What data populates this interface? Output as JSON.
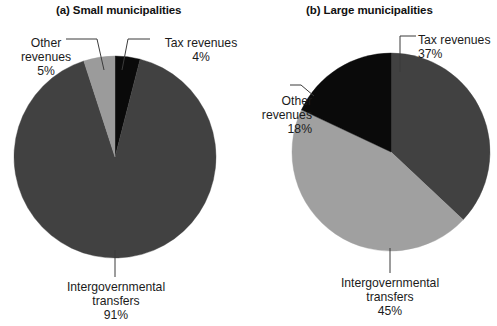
{
  "figure": {
    "background": "#ffffff",
    "panels": [
      {
        "id": "small",
        "title": "(a) Small municipalities",
        "center": {
          "x": 115,
          "y": 157
        },
        "radius": 101,
        "slices": [
          {
            "name": "Tax revenues",
            "value": 4,
            "value_label": "4%",
            "color": "#0a0a0a"
          },
          {
            "name": "Intergovernmental transfers",
            "value": 91,
            "value_label": "91%",
            "color": "#414141"
          },
          {
            "name": "Other revenues",
            "value": 5,
            "value_label": "5%",
            "color": "#9b9b9b"
          }
        ],
        "callouts": [
          {
            "id": "other",
            "lines": [
              "Other",
              "revenues",
              "5%"
            ]
          },
          {
            "id": "tax",
            "lines": [
              "Tax revenues",
              "4%"
            ]
          },
          {
            "id": "intergov",
            "lines": [
              "Intergovernmental",
              "transfers",
              "91%"
            ]
          }
        ]
      },
      {
        "id": "large",
        "title": "(b) Large municipalities",
        "center": {
          "x": 391,
          "y": 152
        },
        "radius": 99,
        "slices": [
          {
            "name": "Tax revenues",
            "value": 37,
            "value_label": "37%",
            "color": "#414141"
          },
          {
            "name": "Intergovernmental transfers",
            "value": 45,
            "value_label": "45%",
            "color": "#a0a0a0"
          },
          {
            "name": "Other revenues",
            "value": 18,
            "value_label": "18%",
            "color": "#0a0a0a"
          }
        ],
        "callouts": [
          {
            "id": "tax",
            "lines": [
              "Tax revenues",
              "37%"
            ]
          },
          {
            "id": "other",
            "lines": [
              "Other",
              "revenues",
              "18%"
            ]
          },
          {
            "id": "intergov",
            "lines": [
              "Intergovernmental",
              "transfers",
              "45%"
            ]
          }
        ]
      }
    ]
  },
  "chart_data": [
    {
      "type": "pie",
      "title": "(a) Small municipalities",
      "xlabel": "",
      "ylabel": "",
      "grid": false,
      "legend": "none (direct callout labels with leader lines)",
      "start_angle_deg": 0,
      "direction": "clockwise",
      "categories": [
        "Tax revenues",
        "Intergovernmental transfers",
        "Other revenues"
      ],
      "values": [
        4,
        91,
        5
      ],
      "value_labels": [
        "4%",
        "91%",
        "5%"
      ],
      "colors": [
        "#0a0a0a",
        "#414141",
        "#9b9b9b"
      ],
      "units": "percent",
      "total": 100
    },
    {
      "type": "pie",
      "title": "(b) Large municipalities",
      "xlabel": "",
      "ylabel": "",
      "grid": false,
      "legend": "none (direct callout labels with leader lines)",
      "start_angle_deg": 0,
      "direction": "clockwise",
      "categories": [
        "Tax revenues",
        "Intergovernmental transfers",
        "Other revenues"
      ],
      "values": [
        37,
        45,
        18
      ],
      "value_labels": [
        "37%",
        "45%",
        "18%"
      ],
      "colors": [
        "#414141",
        "#a0a0a0",
        "#0a0a0a"
      ],
      "units": "percent",
      "total": 100
    }
  ]
}
